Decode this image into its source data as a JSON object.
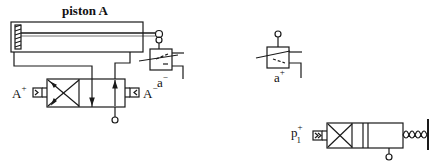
{
  "diagram": {
    "type": "pneumatic circuit",
    "labels": {
      "piston": "piston A",
      "a_plus_letter": "a",
      "a_plus_sign": "+",
      "a_minus_letter": "a",
      "a_minus_sign": "−",
      "A_plus_letter": "A",
      "A_plus_sign": "+",
      "A_minus_letter": "A",
      "A_minus_sign": "−",
      "p1_letter": "p",
      "p1_sign": "+",
      "p1_sub": "1"
    },
    "components": [
      {
        "id": "piston-A",
        "kind": "double-acting cylinder"
      },
      {
        "id": "valve-a-minus",
        "kind": "limit switch valve (roller)"
      },
      {
        "id": "valve-a-plus",
        "kind": "limit switch valve (roller)"
      },
      {
        "id": "valve-main",
        "kind": "4/2 directional valve, pilot operated A+ / A-"
      },
      {
        "id": "valve-p1",
        "kind": "3/2 valve, pilot p1+, spring return"
      }
    ],
    "colors": {
      "ink": "#1a1a1a",
      "background": "#ffffff"
    }
  }
}
